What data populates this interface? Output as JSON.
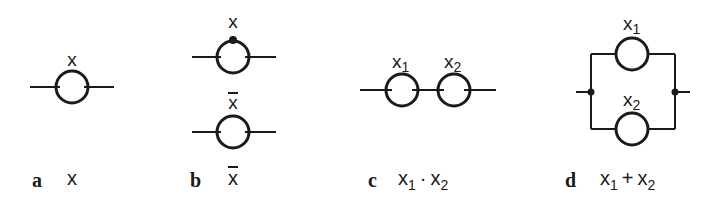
{
  "panels": [
    {
      "id": "a",
      "caption": "a",
      "expression": {
        "var": "x"
      },
      "contacts": [
        {
          "label": "x",
          "type": "normally-open"
        }
      ]
    },
    {
      "id": "b",
      "caption": "b",
      "expression": {
        "var": "x",
        "negated": true
      },
      "contacts": [
        {
          "label": "x",
          "type": "normally-closed-marker"
        },
        {
          "label": "x",
          "negated": true,
          "type": "normally-open"
        }
      ]
    },
    {
      "id": "c",
      "caption": "c",
      "expression": {
        "v1": "x",
        "s1": "1",
        "op": "·",
        "v2": "x",
        "s2": "2"
      },
      "contacts": [
        {
          "label": "x",
          "sub": "1"
        },
        {
          "label": "x",
          "sub": "2"
        }
      ],
      "connection": "series"
    },
    {
      "id": "d",
      "caption": "d",
      "expression": {
        "v1": "x",
        "s1": "1",
        "op": "+",
        "v2": "x",
        "s2": "2"
      },
      "contacts": [
        {
          "label": "x",
          "sub": "1"
        },
        {
          "label": "x",
          "sub": "2"
        }
      ],
      "connection": "parallel"
    }
  ],
  "colors": {
    "stroke": "#1a1a1a",
    "background": "#ffffff"
  }
}
